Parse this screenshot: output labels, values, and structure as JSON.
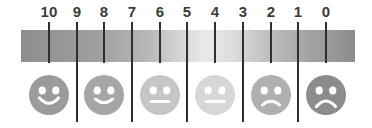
{
  "widget": {
    "title": "Numeric rating scale with faces",
    "width": 372,
    "height": 128,
    "background": "#ffffff"
  },
  "scale": {
    "min": 0,
    "max": 10,
    "direction": "descending-left-to-right",
    "tick_label_color": "#3b3b3b",
    "tick_line_color": "#2f2f2f",
    "ticks": [
      {
        "label": "10",
        "value": 10,
        "x": 49,
        "tick_length": "short"
      },
      {
        "label": "9",
        "value": 9,
        "x": 77,
        "tick_length": "long"
      },
      {
        "label": "8",
        "value": 8,
        "x": 104,
        "tick_length": "short"
      },
      {
        "label": "7",
        "value": 7,
        "x": 132,
        "tick_length": "long"
      },
      {
        "label": "6",
        "value": 6,
        "x": 160,
        "tick_length": "short"
      },
      {
        "label": "5",
        "value": 5,
        "x": 187,
        "tick_length": "long"
      },
      {
        "label": "4",
        "value": 4,
        "x": 215,
        "tick_length": "short"
      },
      {
        "label": "3",
        "value": 3,
        "x": 243,
        "tick_length": "long"
      },
      {
        "label": "2",
        "value": 2,
        "x": 271,
        "tick_length": "short"
      },
      {
        "label": "1",
        "value": 1,
        "x": 298,
        "tick_length": "long"
      },
      {
        "label": "0",
        "value": 0,
        "x": 326,
        "tick_length": "short"
      }
    ]
  },
  "gradient_bar": {
    "left": 21,
    "top": 30,
    "width": 334,
    "height": 32,
    "stops": [
      {
        "offset": "0%",
        "color": "#8e8e8e"
      },
      {
        "offset": "12%",
        "color": "#969696"
      },
      {
        "offset": "25%",
        "color": "#a2a2a2"
      },
      {
        "offset": "38%",
        "color": "#b8b8b8"
      },
      {
        "offset": "48%",
        "color": "#d6d6d6"
      },
      {
        "offset": "55%",
        "color": "#e9e9e9"
      },
      {
        "offset": "63%",
        "color": "#dedede"
      },
      {
        "offset": "74%",
        "color": "#bfbfbf"
      },
      {
        "offset": "86%",
        "color": "#a4a4a4"
      },
      {
        "offset": "100%",
        "color": "#8c8c8c"
      }
    ]
  },
  "faces": [
    {
      "value": 10,
      "x": 49,
      "expression": "very-happy",
      "color": "#9b9b9b",
      "mouth": "big-smile",
      "label": "face-very-happy"
    },
    {
      "value": 8,
      "x": 104,
      "expression": "happy",
      "color": "#a6a6a6",
      "mouth": "smile",
      "label": "face-happy"
    },
    {
      "value": 6,
      "x": 160,
      "expression": "neutral",
      "color": "#c6c6c6",
      "mouth": "flat",
      "label": "face-neutral"
    },
    {
      "value": 4,
      "x": 215,
      "expression": "neutral",
      "color": "#d7d7d7",
      "mouth": "flat",
      "label": "face-slightly-sad"
    },
    {
      "value": 2,
      "x": 271,
      "expression": "sad",
      "color": "#b0b0b0",
      "mouth": "frown",
      "label": "face-sad"
    },
    {
      "value": 0,
      "x": 326,
      "expression": "very-sad",
      "color": "#8c8c8c",
      "mouth": "big-frown",
      "label": "face-very-sad"
    }
  ]
}
